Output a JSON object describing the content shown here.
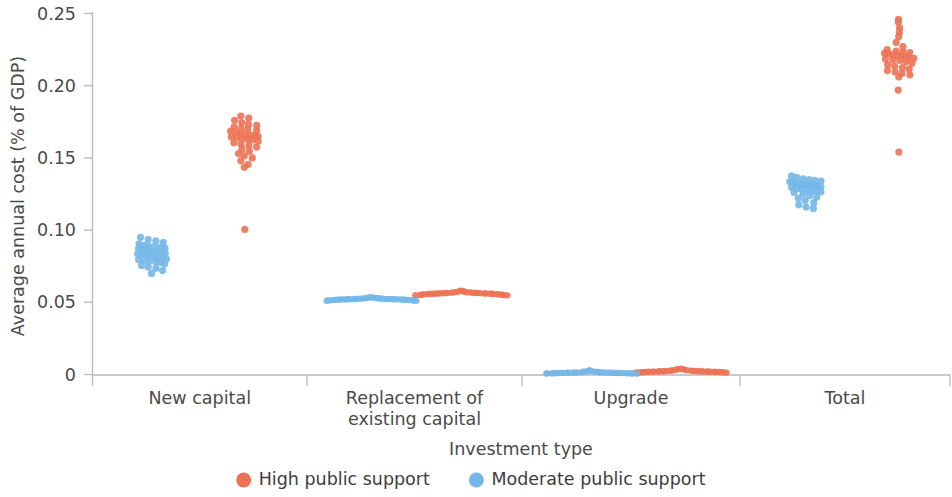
{
  "chart_data": {
    "type": "scatter",
    "title": "",
    "xlabel": "Investment type",
    "ylabel": "Average annual cost (% of GDP)",
    "ylim": [
      0,
      0.25
    ],
    "yticks": [
      0,
      0.05,
      0.1,
      0.15,
      0.2,
      0.25
    ],
    "ytick_labels": [
      "0",
      "0.05",
      "0.10",
      "0.15",
      "0.20",
      "0.25"
    ],
    "grid": false,
    "legend_position": "bottom",
    "categories": [
      "New capital",
      "Replacement of\nexisting capital",
      "Upgrade",
      "Total"
    ],
    "category_labels": [
      {
        "line1": "New capital",
        "line2": ""
      },
      {
        "line1": "Replacement of",
        "line2": "existing capital"
      },
      {
        "line1": "Upgrade",
        "line2": ""
      },
      {
        "line1": "Total",
        "line2": ""
      }
    ],
    "series": [
      {
        "name": "High public support",
        "color": "#EC7354",
        "marker": "circle",
        "groups": [
          {
            "category": "New capital",
            "center": 0.163,
            "values": [
              0.179,
              0.1775,
              0.176,
              0.1745,
              0.173,
              0.1725,
              0.1715,
              0.1705,
              0.17,
              0.169,
              0.1685,
              0.1675,
              0.167,
              0.1665,
              0.166,
              0.1655,
              0.165,
              0.1645,
              0.164,
              0.1635,
              0.163,
              0.1625,
              0.1615,
              0.1605,
              0.1595,
              0.1585,
              0.1575,
              0.156,
              0.1545,
              0.153,
              0.1515,
              0.15,
              0.148,
              0.1455,
              0.1435,
              0.1005
            ]
          },
          {
            "category": "Replacement of existing capital",
            "center": 0.0565,
            "values": [
              0.058,
              0.0578,
              0.0576,
              0.0574,
              0.0572,
              0.057,
              0.0569,
              0.0568,
              0.0567,
              0.0566,
              0.0565,
              0.0565,
              0.0564,
              0.0564,
              0.0563,
              0.0563,
              0.0562,
              0.0562,
              0.0561,
              0.0561,
              0.056,
              0.056,
              0.0559,
              0.0559,
              0.0558,
              0.0558,
              0.0557,
              0.0556,
              0.0555,
              0.0554,
              0.0553,
              0.0552,
              0.0551,
              0.055,
              0.0549,
              0.0548
            ]
          },
          {
            "category": "Upgrade",
            "center": 0.0022,
            "values": [
              0.004,
              0.0038,
              0.0036,
              0.0034,
              0.0032,
              0.003,
              0.0028,
              0.0027,
              0.0026,
              0.0025,
              0.0024,
              0.0024,
              0.0023,
              0.0023,
              0.0022,
              0.0022,
              0.0022,
              0.0021,
              0.0021,
              0.0021,
              0.002,
              0.002,
              0.002,
              0.0019,
              0.0019,
              0.0019,
              0.0018,
              0.0018,
              0.0017,
              0.0017,
              0.0016,
              0.0016,
              0.0015,
              0.0015,
              0.0014,
              0.0013
            ]
          },
          {
            "category": "Total",
            "center": 0.2205,
            "values": [
              0.246,
              0.244,
              0.24,
              0.237,
              0.234,
              0.23,
              0.227,
              0.225,
              0.224,
              0.2235,
              0.223,
              0.2225,
              0.222,
              0.2215,
              0.221,
              0.2205,
              0.22,
              0.2195,
              0.219,
              0.2185,
              0.218,
              0.2175,
              0.2165,
              0.2155,
              0.2145,
              0.2135,
              0.2125,
              0.2115,
              0.2105,
              0.2095,
              0.2085,
              0.2075,
              0.206,
              0.197,
              0.154
            ]
          }
        ]
      },
      {
        "name": "Moderate public support",
        "color": "#74B7E8",
        "marker": "circle",
        "groups": [
          {
            "category": "New capital",
            "center": 0.082,
            "values": [
              0.095,
              0.0935,
              0.0925,
              0.0915,
              0.0905,
              0.0895,
              0.089,
              0.0885,
              0.088,
              0.0875,
              0.087,
              0.0865,
              0.086,
              0.0855,
              0.085,
              0.0845,
              0.084,
              0.0835,
              0.083,
              0.0825,
              0.082,
              0.0815,
              0.081,
              0.0805,
              0.08,
              0.0795,
              0.079,
              0.0785,
              0.078,
              0.0775,
              0.0765,
              0.0755,
              0.0745,
              0.0735,
              0.072,
              0.07
            ]
          },
          {
            "category": "Replacement of existing capital",
            "center": 0.0522,
            "values": [
              0.0535,
              0.0533,
              0.0531,
              0.053,
              0.0529,
              0.0528,
              0.0527,
              0.0526,
              0.0525,
              0.0525,
              0.0524,
              0.0524,
              0.0523,
              0.0523,
              0.0522,
              0.0522,
              0.0522,
              0.0521,
              0.0521,
              0.0521,
              0.052,
              0.052,
              0.052,
              0.0519,
              0.0519,
              0.0518,
              0.0518,
              0.0517,
              0.0517,
              0.0516,
              0.0515,
              0.0514,
              0.0513,
              0.0512,
              0.0511,
              0.051
            ]
          },
          {
            "category": "Upgrade",
            "center": 0.0012,
            "values": [
              0.003,
              0.0025,
              0.0022,
              0.002,
              0.0019,
              0.0018,
              0.0017,
              0.0016,
              0.0015,
              0.0015,
              0.0014,
              0.0014,
              0.0013,
              0.0013,
              0.0013,
              0.0012,
              0.0012,
              0.0012,
              0.0012,
              0.0011,
              0.0011,
              0.0011,
              0.0011,
              0.001,
              0.001,
              0.001,
              0.001,
              0.0009,
              0.0009,
              0.0009,
              0.0008,
              0.0008,
              0.0008,
              0.0007,
              0.0007,
              0.0006
            ]
          },
          {
            "category": "Total",
            "center": 0.131,
            "values": [
              0.1375,
              0.1365,
              0.1355,
              0.135,
              0.1345,
              0.134,
              0.1335,
              0.133,
              0.1325,
              0.132,
              0.1318,
              0.1315,
              0.1312,
              0.131,
              0.1308,
              0.1305,
              0.1302,
              0.13,
              0.1295,
              0.129,
              0.1285,
              0.128,
              0.1275,
              0.127,
              0.1265,
              0.126,
              0.125,
              0.124,
              0.123,
              0.122,
              0.1205,
              0.119,
              0.1175,
              0.116,
              0.115
            ]
          }
        ]
      }
    ],
    "legend": [
      {
        "label": "High public support",
        "color": "#EC7354"
      },
      {
        "label": "Moderate public support",
        "color": "#74B7E8"
      }
    ]
  }
}
